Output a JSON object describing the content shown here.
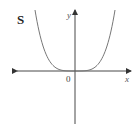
{
  "chart_data": {
    "type": "line",
    "title": "S",
    "xlabel": "x",
    "ylabel": "y",
    "origin_label": "0",
    "function_shape": "even-degree curve, flat minimum at origin (approx. y = x^4)",
    "series": [
      {
        "name": "curve",
        "x": [
          -1.0,
          -0.8,
          -0.6,
          -0.4,
          -0.2,
          0.0,
          0.2,
          0.4,
          0.6,
          0.8,
          1.0
        ],
        "values": [
          1.0,
          0.41,
          0.13,
          0.026,
          0.0016,
          0.0,
          0.0016,
          0.026,
          0.13,
          0.41,
          1.0
        ]
      }
    ],
    "grid": false,
    "legend": "none",
    "axes": {
      "x_arrows": "both",
      "y_arrows": "up"
    },
    "colors": {
      "curve": "#777777",
      "axis": "#333333"
    }
  },
  "labels": {
    "panel": "S",
    "x": "x",
    "y": "y",
    "origin": "0"
  }
}
